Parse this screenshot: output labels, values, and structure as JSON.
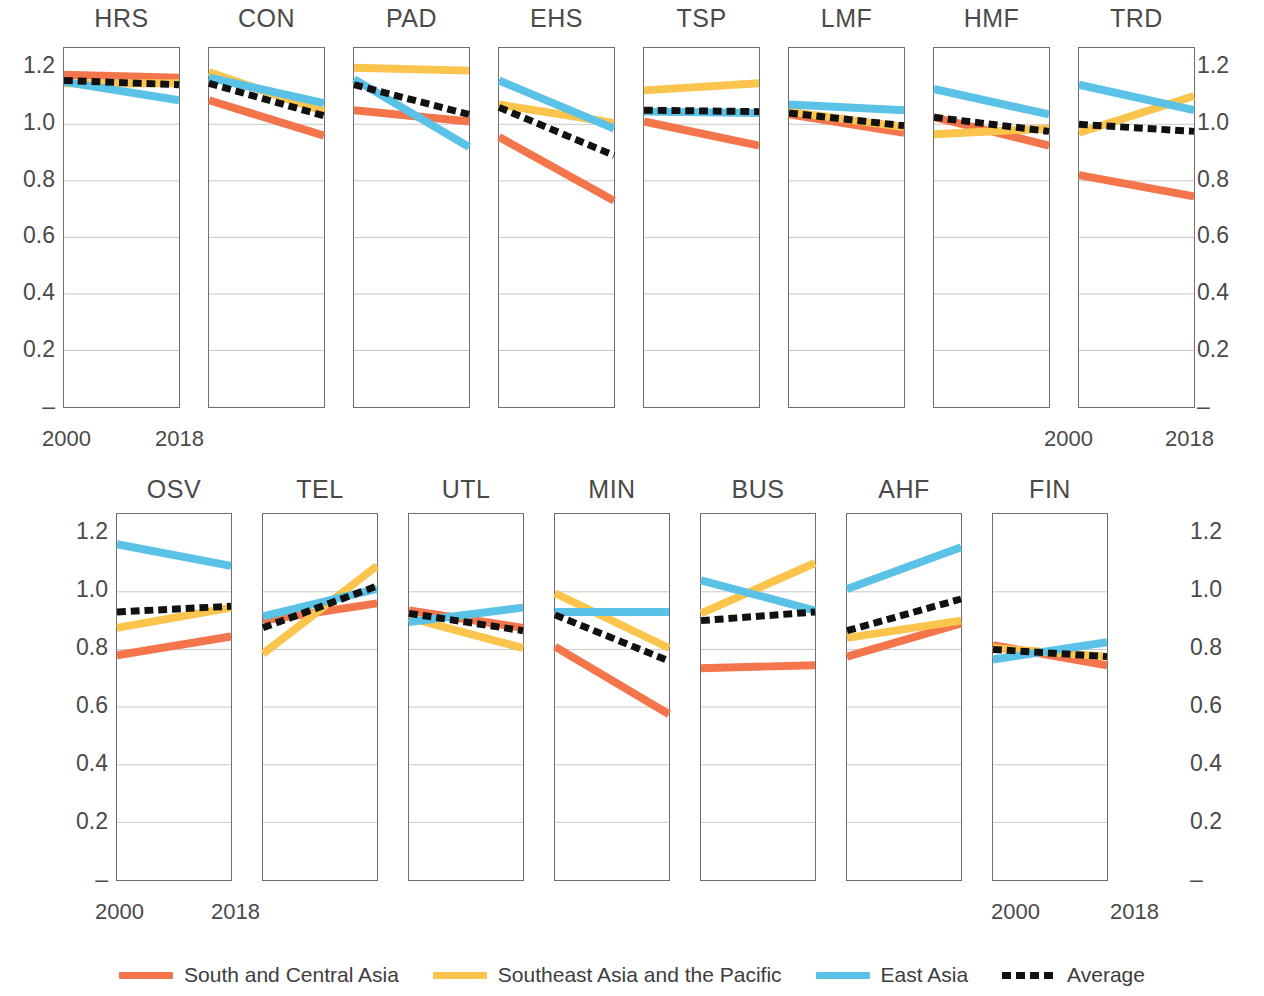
{
  "axis": {
    "y_ticks": [
      "1.2",
      "1.0",
      "0.8",
      "0.6",
      "0.4",
      "0.2",
      "–"
    ],
    "y_values": [
      1.2,
      1.0,
      0.8,
      0.6,
      0.4,
      0.2,
      0.0
    ],
    "x_start_label": "2000",
    "x_end_label": "2018"
  },
  "legend": {
    "items": [
      {
        "label": "South and Central Asia",
        "color": "#F4754B",
        "style": "solid"
      },
      {
        "label": "Southeast Asia and the Pacific",
        "color": "#FBC44D",
        "style": "solid"
      },
      {
        "label": "East Asia",
        "color": "#5BC2E7",
        "style": "solid"
      },
      {
        "label": "Average",
        "color": "#111111",
        "style": "dashed"
      }
    ]
  },
  "colors": {
    "south_central_asia": "#F4754B",
    "southeast_asia_pacific": "#FBC44D",
    "east_asia": "#5BC2E7",
    "average": "#111111",
    "frame": "#6e6e6e",
    "grid": "#b9b9b9",
    "text": "#4a4a4a"
  },
  "chart_data": {
    "type": "line",
    "title": "",
    "xlabel": "",
    "ylabel": "",
    "x": [
      2000,
      2018
    ],
    "xlim": [
      2000,
      2018
    ],
    "ylim": [
      0,
      1.27
    ],
    "grid": "horizontal gridlines at 0.2 intervals",
    "legend_position": "bottom-center",
    "series_names": [
      "South and Central Asia",
      "Southeast Asia and the Pacific",
      "East Asia",
      "Average"
    ],
    "panels": [
      {
        "name": "HRS",
        "row": 1,
        "series": [
          {
            "name": "South and Central Asia",
            "key": "south_central_asia",
            "values": [
              1.175,
              1.165
            ]
          },
          {
            "name": "Southeast Asia and the Pacific",
            "key": "southeast_asia_pacific",
            "values": [
              1.145,
              1.145
            ]
          },
          {
            "name": "East Asia",
            "key": "east_asia",
            "values": [
              1.15,
              1.085
            ]
          },
          {
            "name": "Average",
            "key": "average",
            "values": [
              1.155,
              1.14
            ]
          }
        ]
      },
      {
        "name": "CON",
        "row": 1,
        "series": [
          {
            "name": "South and Central Asia",
            "key": "south_central_asia",
            "values": [
              1.085,
              0.96
            ]
          },
          {
            "name": "Southeast Asia and the Pacific",
            "key": "southeast_asia_pacific",
            "values": [
              1.185,
              1.045
            ]
          },
          {
            "name": "East Asia",
            "key": "east_asia",
            "values": [
              1.165,
              1.075
            ]
          },
          {
            "name": "Average",
            "key": "average",
            "values": [
              1.145,
              1.03
            ]
          }
        ]
      },
      {
        "name": "PAD",
        "row": 1,
        "series": [
          {
            "name": "South and Central Asia",
            "key": "south_central_asia",
            "values": [
              1.05,
              1.01
            ]
          },
          {
            "name": "Southeast Asia and the Pacific",
            "key": "southeast_asia_pacific",
            "values": [
              1.2,
              1.19
            ]
          },
          {
            "name": "East Asia",
            "key": "east_asia",
            "values": [
              1.16,
              0.92
            ]
          },
          {
            "name": "Average",
            "key": "average",
            "values": [
              1.14,
              1.035
            ]
          }
        ]
      },
      {
        "name": "EHS",
        "row": 1,
        "series": [
          {
            "name": "South and Central Asia",
            "key": "south_central_asia",
            "values": [
              0.955,
              0.73
            ]
          },
          {
            "name": "Southeast Asia and the Pacific",
            "key": "southeast_asia_pacific",
            "values": [
              1.07,
              1.005
            ]
          },
          {
            "name": "East Asia",
            "key": "east_asia",
            "values": [
              1.155,
              0.985
            ]
          },
          {
            "name": "Average",
            "key": "average",
            "values": [
              1.06,
              0.89
            ]
          }
        ]
      },
      {
        "name": "TSP",
        "row": 1,
        "series": [
          {
            "name": "South and Central Asia",
            "key": "south_central_asia",
            "values": [
              1.01,
              0.925
            ]
          },
          {
            "name": "Southeast Asia and the Pacific",
            "key": "southeast_asia_pacific",
            "values": [
              1.12,
              1.145
            ]
          },
          {
            "name": "East Asia",
            "key": "east_asia",
            "values": [
              1.045,
              1.04
            ]
          },
          {
            "name": "Average",
            "key": "average",
            "values": [
              1.05,
              1.045
            ]
          }
        ]
      },
      {
        "name": "LMF",
        "row": 1,
        "series": [
          {
            "name": "South and Central Asia",
            "key": "south_central_asia",
            "values": [
              1.035,
              0.97
            ]
          },
          {
            "name": "Southeast Asia and the Pacific",
            "key": "southeast_asia_pacific",
            "values": [
              1.045,
              0.99
            ]
          },
          {
            "name": "East Asia",
            "key": "east_asia",
            "values": [
              1.07,
              1.05
            ]
          },
          {
            "name": "Average",
            "key": "average",
            "values": [
              1.04,
              0.995
            ]
          }
        ]
      },
      {
        "name": "HMF",
        "row": 1,
        "series": [
          {
            "name": "South and Central Asia",
            "key": "south_central_asia",
            "values": [
              1.025,
              0.925
            ]
          },
          {
            "name": "Southeast Asia and the Pacific",
            "key": "southeast_asia_pacific",
            "values": [
              0.965,
              0.985
            ]
          },
          {
            "name": "East Asia",
            "key": "east_asia",
            "values": [
              1.125,
              1.035
            ]
          },
          {
            "name": "Average",
            "key": "average",
            "values": [
              1.025,
              0.975
            ]
          }
        ]
      },
      {
        "name": "TRD",
        "row": 1,
        "series": [
          {
            "name": "South and Central Asia",
            "key": "south_central_asia",
            "values": [
              0.82,
              0.745
            ]
          },
          {
            "name": "Southeast Asia and the Pacific",
            "key": "southeast_asia_pacific",
            "values": [
              0.97,
              1.1
            ]
          },
          {
            "name": "East Asia",
            "key": "east_asia",
            "values": [
              1.14,
              1.05
            ]
          },
          {
            "name": "Average",
            "key": "average",
            "values": [
              1.0,
              0.975
            ]
          }
        ]
      },
      {
        "name": "OSV",
        "row": 2,
        "series": [
          {
            "name": "South and Central Asia",
            "key": "south_central_asia",
            "values": [
              0.78,
              0.845
            ]
          },
          {
            "name": "Southeast Asia and the Pacific",
            "key": "southeast_asia_pacific",
            "values": [
              0.875,
              0.945
            ]
          },
          {
            "name": "East Asia",
            "key": "east_asia",
            "values": [
              1.165,
              1.09
            ]
          },
          {
            "name": "Average",
            "key": "average",
            "values": [
              0.93,
              0.95
            ]
          }
        ]
      },
      {
        "name": "TEL",
        "row": 2,
        "series": [
          {
            "name": "South and Central Asia",
            "key": "south_central_asia",
            "values": [
              0.9,
              0.96
            ]
          },
          {
            "name": "Southeast Asia and the Pacific",
            "key": "southeast_asia_pacific",
            "values": [
              0.785,
              1.09
            ]
          },
          {
            "name": "East Asia",
            "key": "east_asia",
            "values": [
              0.915,
              1.01
            ]
          },
          {
            "name": "Average",
            "key": "average",
            "values": [
              0.875,
              1.02
            ]
          }
        ]
      },
      {
        "name": "UTL",
        "row": 2,
        "series": [
          {
            "name": "South and Central Asia",
            "key": "south_central_asia",
            "values": [
              0.935,
              0.875
            ]
          },
          {
            "name": "Southeast Asia and the Pacific",
            "key": "southeast_asia_pacific",
            "values": [
              0.91,
              0.805
            ]
          },
          {
            "name": "East Asia",
            "key": "east_asia",
            "values": [
              0.895,
              0.945
            ]
          },
          {
            "name": "Average",
            "key": "average",
            "values": [
              0.925,
              0.865
            ]
          }
        ]
      },
      {
        "name": "MIN",
        "row": 2,
        "series": [
          {
            "name": "South and Central Asia",
            "key": "south_central_asia",
            "values": [
              0.81,
              0.575
            ]
          },
          {
            "name": "Southeast Asia and the Pacific",
            "key": "southeast_asia_pacific",
            "values": [
              0.995,
              0.805
            ]
          },
          {
            "name": "East Asia",
            "key": "east_asia",
            "values": [
              0.93,
              0.93
            ]
          },
          {
            "name": "Average",
            "key": "average",
            "values": [
              0.92,
              0.76
            ]
          }
        ]
      },
      {
        "name": "BUS",
        "row": 2,
        "series": [
          {
            "name": "South and Central Asia",
            "key": "south_central_asia",
            "values": [
              0.735,
              0.745
            ]
          },
          {
            "name": "Southeast Asia and the Pacific",
            "key": "southeast_asia_pacific",
            "values": [
              0.925,
              1.1
            ]
          },
          {
            "name": "East Asia",
            "key": "east_asia",
            "values": [
              1.04,
              0.935
            ]
          },
          {
            "name": "Average",
            "key": "average",
            "values": [
              0.9,
              0.93
            ]
          }
        ]
      },
      {
        "name": "AHF",
        "row": 2,
        "series": [
          {
            "name": "South and Central Asia",
            "key": "south_central_asia",
            "values": [
              0.775,
              0.89
            ]
          },
          {
            "name": "Southeast Asia and the Pacific",
            "key": "southeast_asia_pacific",
            "values": [
              0.84,
              0.9
            ]
          },
          {
            "name": "East Asia",
            "key": "east_asia",
            "values": [
              1.01,
              1.155
            ]
          },
          {
            "name": "Average",
            "key": "average",
            "values": [
              0.865,
              0.975
            ]
          }
        ]
      },
      {
        "name": "FIN",
        "row": 2,
        "series": [
          {
            "name": "South and Central Asia",
            "key": "south_central_asia",
            "values": [
              0.815,
              0.745
            ]
          },
          {
            "name": "Southeast Asia and the Pacific",
            "key": "southeast_asia_pacific",
            "values": [
              0.805,
              0.775
            ]
          },
          {
            "name": "East Asia",
            "key": "east_asia",
            "values": [
              0.765,
              0.825
            ]
          },
          {
            "name": "Average",
            "key": "average",
            "values": [
              0.8,
              0.775
            ]
          }
        ]
      }
    ]
  }
}
